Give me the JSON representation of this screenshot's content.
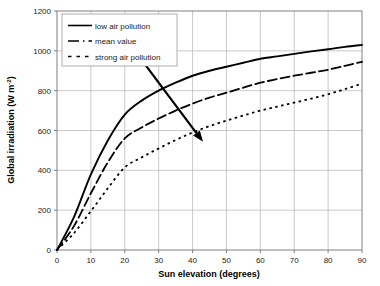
{
  "chart_data": {
    "type": "line",
    "title": "",
    "xlabel": "Sun elevation (degrees)",
    "ylabel": "Global irradiation (W m-2)",
    "ylabel_base": "Global irradiation (W m",
    "ylabel_exponent": "-2",
    "ylabel_close": ")",
    "xlim": [
      0,
      90
    ],
    "ylim": [
      0,
      1200
    ],
    "xticks": [
      0,
      10,
      20,
      30,
      40,
      50,
      60,
      70,
      80,
      90
    ],
    "yticks": [
      0,
      200,
      400,
      600,
      800,
      1000,
      1200
    ],
    "grid": true,
    "grid_color": "#b3b3b3",
    "axis_color": "#808080",
    "legend_position": "top-left-inside",
    "x": [
      0,
      5,
      10,
      15,
      20,
      25,
      30,
      35,
      40,
      45,
      50,
      55,
      60,
      65,
      70,
      75,
      80,
      85,
      90
    ],
    "series": [
      {
        "name": "low air pollution",
        "style": "solid",
        "color": "#000000",
        "values": [
          0,
          165,
          380,
          550,
          680,
          750,
          800,
          840,
          875,
          900,
          920,
          940,
          960,
          972,
          985,
          997,
          1008,
          1020,
          1030
        ]
      },
      {
        "name": "mean value",
        "style": "dashed",
        "color": "#000000",
        "values": [
          0,
          120,
          285,
          440,
          560,
          615,
          660,
          700,
          735,
          765,
          790,
          815,
          840,
          858,
          875,
          890,
          905,
          925,
          945
        ]
      },
      {
        "name": "strong air pollution",
        "style": "dotted",
        "color": "#000000",
        "values": [
          0,
          85,
          195,
          310,
          415,
          465,
          510,
          552,
          590,
          622,
          650,
          675,
          700,
          720,
          740,
          760,
          782,
          808,
          835
        ]
      }
    ],
    "annotations": [
      {
        "name": "increasing-pollution-arrow",
        "type": "arrow",
        "x1": 22.1,
        "y1": 1020,
        "x2": 43.1,
        "y2": 543
      }
    ]
  },
  "legend": {
    "items": [
      {
        "label": "low air pollution",
        "style": "solid"
      },
      {
        "label": "mean value",
        "style": "dashed"
      },
      {
        "label": "strong air pollution",
        "style": "dotted"
      }
    ]
  }
}
